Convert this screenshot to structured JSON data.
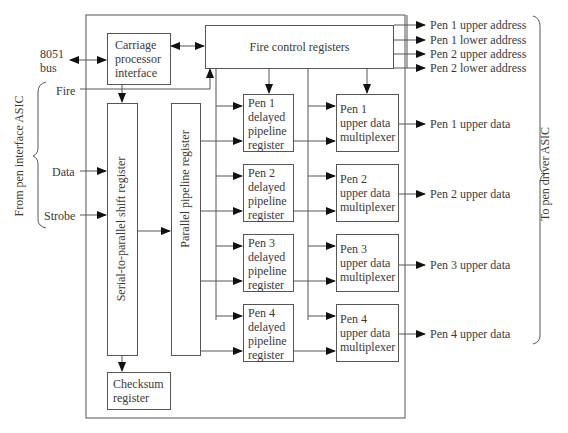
{
  "diagram": {
    "inputs": {
      "bus": "8051\nbus",
      "bus_line1": "8051",
      "bus_line2": "bus",
      "fire": "Fire",
      "data": "Data",
      "strobe": "Strobe",
      "group_label": "From pen interface ASIC"
    },
    "blocks": {
      "carriage": [
        "Carriage",
        "processor",
        "interface"
      ],
      "fire_control": "Fire control registers",
      "serial_shift": "Serial-to-parallel shift register",
      "parallel_pipeline": "Parallel pipeline register",
      "checksum": [
        "Checksum",
        "register"
      ],
      "delayed": [
        [
          "Pen 1",
          "delayed",
          "pipeline",
          "register"
        ],
        [
          "Pen 2",
          "delayed",
          "pipeline",
          "register"
        ],
        [
          "Pen 3",
          "delayed",
          "pipeline",
          "register"
        ],
        [
          "Pen 4",
          "delayed",
          "pipeline",
          "register"
        ]
      ],
      "mux": [
        [
          "Pen 1",
          "upper data",
          "multiplexer"
        ],
        [
          "Pen 2",
          "upper data",
          "multiplexer"
        ],
        [
          "Pen 3",
          "upper data",
          "multiplexer"
        ],
        [
          "Pen 4",
          "upper data",
          "multiplexer"
        ]
      ]
    },
    "outputs": {
      "addresses": [
        "Pen 1 upper address",
        "Pen 1 lower address",
        "Pen 2 upper address",
        "Pen 2 lower address"
      ],
      "data": [
        "Pen 1 upper data",
        "Pen 2 upper data",
        "Pen 3 upper data",
        "Pen 4 upper data"
      ],
      "group_label": "To pen driver ASIC"
    }
  }
}
